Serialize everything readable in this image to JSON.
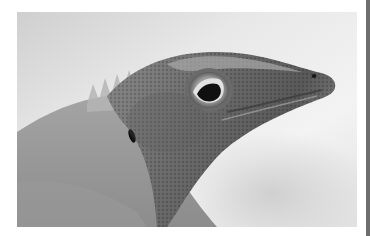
{
  "image": {
    "subject": "Close-up grayscale photograph of an anole lizard head in profile facing right",
    "alt": "Grayscale close-up of a lizard's head",
    "colors": {
      "background_page": "#ffffff",
      "sky_light": "#f2f2f2",
      "sky_mid": "#d4d4d4",
      "skin_dark": "#4a4a4a",
      "skin_mid": "#7d7d7d",
      "skin_light": "#a8a8a8",
      "eye_pupil": "#111111",
      "eye_ring": "#c9c9c9",
      "right_rule": "#6e6e6e"
    }
  }
}
